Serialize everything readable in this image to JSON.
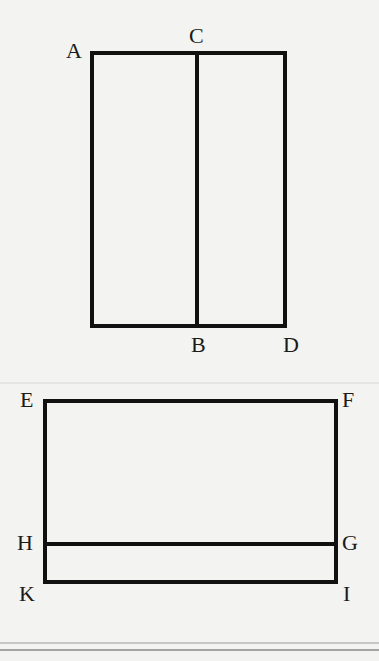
{
  "figure_1": {
    "shape": "rectangle divided vertically",
    "labels": {
      "A": "A",
      "C": "C",
      "B": "B",
      "D": "D"
    },
    "rect": {
      "x": 92,
      "y": 53,
      "width": 193,
      "height": 273
    },
    "divider": {
      "x": 197,
      "from": "C",
      "to": "B"
    }
  },
  "figure_2": {
    "shape": "rectangle divided horizontally",
    "labels": {
      "E": "E",
      "F": "F",
      "H": "H",
      "G": "G",
      "K": "K",
      "I": "I"
    },
    "rect": {
      "x": 45,
      "y": 401,
      "width": 291,
      "height": 181
    },
    "divider": {
      "y": 544,
      "from": "H",
      "to": "G"
    }
  },
  "colors": {
    "background": "#f3f3f1",
    "stroke": "#111111",
    "rule": "#9a9a9a"
  }
}
